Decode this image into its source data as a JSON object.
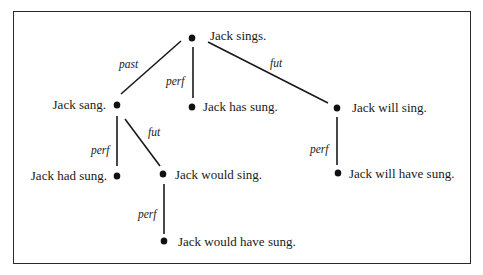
{
  "diagram": {
    "type": "tense-tree",
    "nodes": [
      {
        "id": "root",
        "label": "Jack sings."
      },
      {
        "id": "past",
        "label": "Jack sang."
      },
      {
        "id": "perf",
        "label": "Jack has sung."
      },
      {
        "id": "fut",
        "label": "Jack will sing."
      },
      {
        "id": "past_perf",
        "label": "Jack had sung."
      },
      {
        "id": "past_fut",
        "label": "Jack would sing."
      },
      {
        "id": "past_fut_perf",
        "label": "Jack would have sung."
      },
      {
        "id": "fut_perf",
        "label": "Jack will have sung."
      }
    ],
    "edges": [
      {
        "from": "root",
        "to": "past",
        "label": "past"
      },
      {
        "from": "root",
        "to": "perf",
        "label": "perf"
      },
      {
        "from": "root",
        "to": "fut",
        "label": "fut"
      },
      {
        "from": "past",
        "to": "past_perf",
        "label": "perf"
      },
      {
        "from": "past",
        "to": "past_fut",
        "label": "fut"
      },
      {
        "from": "past_fut",
        "to": "past_fut_perf",
        "label": "perf"
      },
      {
        "from": "fut",
        "to": "fut_perf",
        "label": "perf"
      }
    ]
  },
  "colors": {
    "line": "#1a1a1a",
    "dot": "#111111",
    "frame": "#2a2a2a"
  }
}
